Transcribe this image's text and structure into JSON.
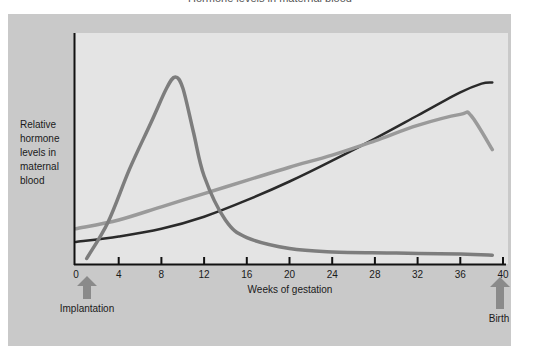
{
  "chart_data": {
    "type": "line",
    "title": "Hormone levels in maternal blood",
    "xlabel": "Weeks of gestation",
    "ylabel": "Relative hormone levels in maternal blood",
    "xlim": [
      0,
      40
    ],
    "ylim": [
      0,
      100
    ],
    "x_ticks": [
      0,
      4,
      8,
      12,
      16,
      20,
      24,
      28,
      32,
      36,
      40
    ],
    "y_ticks": [],
    "grid": false,
    "legend": null,
    "annotations": [
      {
        "label": "Implantation",
        "x": 1,
        "type": "arrow-up"
      },
      {
        "label": "Birth",
        "x": 40,
        "type": "arrow-up"
      }
    ],
    "series": [
      {
        "name": "dark-curve",
        "color": "#2a2a2a",
        "x": [
          0,
          4,
          8,
          12,
          16,
          20,
          24,
          28,
          32,
          36,
          38,
          39
        ],
        "y": [
          10,
          12.5,
          16,
          21.5,
          29,
          37.5,
          47,
          57,
          67.5,
          78,
          82,
          82.5
        ]
      },
      {
        "name": "light-gray-curve",
        "color": "#9a9a9a",
        "x": [
          0,
          4,
          8,
          12,
          16,
          20,
          24,
          28,
          32,
          36,
          37,
          39
        ],
        "y": [
          16,
          20,
          26,
          32,
          38,
          44,
          49.5,
          56,
          63,
          68,
          67.5,
          52
        ]
      },
      {
        "name": "peak-curve",
        "color": "#7d7d7d",
        "x": [
          1,
          3,
          5,
          7,
          8.5,
          9.3,
          10,
          11,
          12,
          14,
          16,
          20,
          24,
          30,
          36,
          39
        ],
        "y": [
          2.5,
          19,
          43,
          64,
          80,
          85,
          80,
          60,
          40,
          20,
          12,
          7,
          5.5,
          5,
          4.5,
          4
        ]
      }
    ]
  },
  "page": {
    "title_fragment": "Hormone levels in maternal blood",
    "ylabel_lines": [
      "Relative",
      "hormone",
      "levels in",
      "maternal",
      "blood"
    ],
    "xlabel": "Weeks of gestation",
    "implantation_label": "Implantation",
    "birth_label": "Birth"
  }
}
